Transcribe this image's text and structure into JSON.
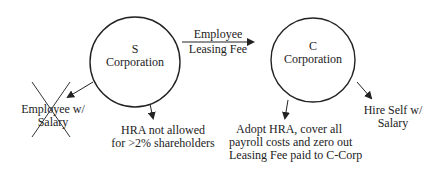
{
  "nodes": {
    "s_corp": {
      "line1": "S",
      "line2": "Corporation"
    },
    "c_corp": {
      "line1": "C",
      "line2": "Corporation"
    }
  },
  "edges": {
    "leasing_fee": {
      "line1": "Employee",
      "line2": "Leasing Fee"
    }
  },
  "outcomes": {
    "employee_salary": {
      "line1": "Employee w/",
      "line2": "Salary",
      "crossed_out": true
    },
    "hra_not_allowed": {
      "line1": "HRA not allowed",
      "line2": "for >2% shareholders"
    },
    "adopt_hra": {
      "line1": "Adopt HRA, cover all",
      "line2": "payroll costs and zero out",
      "line3": "Leasing Fee paid to C-Corp"
    },
    "hire_self": {
      "line1": "Hire Self w/",
      "line2": "Salary"
    }
  }
}
